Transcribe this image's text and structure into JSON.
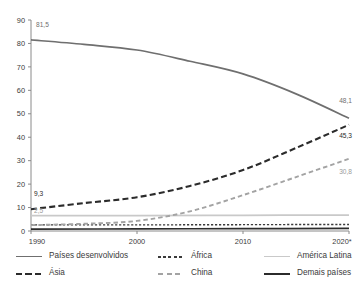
{
  "chart_data": {
    "type": "line",
    "title": "",
    "subtitle": "",
    "xlabel": "",
    "ylabel": "",
    "x": [
      1990,
      2000,
      2010,
      2020
    ],
    "xtick_labels": [
      "1990",
      "2000",
      "2010",
      "2020*"
    ],
    "ytick_labels": [
      "0",
      "10",
      "20",
      "30",
      "40",
      "50",
      "60",
      "70",
      "80",
      "90"
    ],
    "ylim": [
      0,
      90
    ],
    "xlim": [
      1990,
      2020
    ],
    "grid": false,
    "legend_position": "bottom",
    "series": [
      {
        "name": "Países desenvolvidos",
        "color": "#6f6f6f",
        "style": "solid",
        "x": [
          1990,
          1995,
          2000,
          2005,
          2010,
          2015,
          2020
        ],
        "values": [
          81.5,
          79.6,
          77.2,
          72.4,
          67.0,
          58.5,
          48.1
        ],
        "start_label": "81,5",
        "end_label": "48,1"
      },
      {
        "name": "Ásia",
        "color": "#2b2b2b",
        "style": "long-dash",
        "x": [
          1990,
          1995,
          2000,
          2005,
          2010,
          2015,
          2020
        ],
        "values": [
          9.3,
          11.9,
          14.4,
          19.2,
          26.0,
          35.4,
          45.3
        ],
        "start_label": "9,3",
        "end_label": "45,3"
      },
      {
        "name": "China",
        "color": "#a3a3a3",
        "style": "dash",
        "x": [
          1990,
          1995,
          2000,
          2005,
          2010,
          2015,
          2020
        ],
        "values": [
          2.5,
          3.1,
          4.3,
          8.4,
          15.3,
          23.0,
          30.8
        ],
        "start_label": "2,5",
        "end_label": "30,8"
      },
      {
        "name": "África",
        "color": "#3a3a3a",
        "style": "short-dash",
        "x": [
          1990,
          2000,
          2010,
          2020
        ],
        "values": [
          2.6,
          2.6,
          2.7,
          2.8
        ],
        "start_label": "",
        "end_label": ""
      },
      {
        "name": "América Latina",
        "color": "#c9c9c9",
        "style": "solid",
        "x": [
          1990,
          2000,
          2010,
          2020
        ],
        "values": [
          6.6,
          6.6,
          6.7,
          6.8
        ],
        "start_label": "",
        "end_label": ""
      },
      {
        "name": "Demais países",
        "color": "#2b2b2b",
        "style": "solid",
        "x": [
          1990,
          2000,
          2010,
          2020
        ],
        "values": [
          0.8,
          0.9,
          1.0,
          1.1
        ],
        "start_label": "",
        "end_label": ""
      }
    ],
    "annotations": [
      {
        "text": "81,5",
        "series": "Países desenvolvidos",
        "anchor": "start"
      },
      {
        "text": "48,1",
        "series": "Países desenvolvidos",
        "anchor": "end"
      },
      {
        "text": "9,3",
        "series": "Ásia",
        "anchor": "start"
      },
      {
        "text": "45,3",
        "series": "Ásia",
        "anchor": "end"
      },
      {
        "text": "2,5",
        "series": "China",
        "anchor": "start"
      },
      {
        "text": "30,8",
        "series": "China",
        "anchor": "end"
      }
    ]
  },
  "axes": {
    "y_ticks": [
      "0",
      "10",
      "20",
      "30",
      "40",
      "50",
      "60",
      "70",
      "80",
      "90"
    ],
    "x_ticks": [
      "1990",
      "2000",
      "2010",
      "2020*"
    ]
  },
  "legend": {
    "items": [
      {
        "label": "Países desenvolvidos",
        "color": "#6f6f6f",
        "style": "solid"
      },
      {
        "label": "África",
        "color": "#3a3a3a",
        "style": "short-dash"
      },
      {
        "label": "América Latina",
        "color": "#c9c9c9",
        "style": "solid"
      },
      {
        "label": "Ásia",
        "color": "#2b2b2b",
        "style": "long-dash"
      },
      {
        "label": "China",
        "color": "#a3a3a3",
        "style": "dash"
      },
      {
        "label": "Demais países",
        "color": "#2b2b2b",
        "style": "solid"
      }
    ]
  },
  "labels": {
    "dev_start": "81,5",
    "dev_end": "48,1",
    "asia_start": "9,3",
    "asia_end": "45,3",
    "china_start": "2,5",
    "china_end": "30,8"
  }
}
